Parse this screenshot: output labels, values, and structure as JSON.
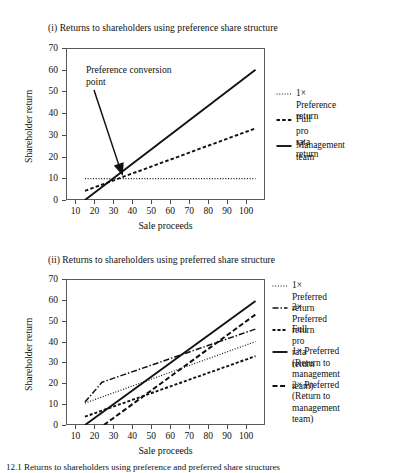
{
  "figure": {
    "caption": "12.1   Returns to shareholders using preference and preferred share structures"
  },
  "panels": [
    {
      "id": "panel-1",
      "title": "(i) Returns to shareholders using preference share structure",
      "xlabel": "Sale proceeds",
      "ylabel": "Shareholder return",
      "annotation": "Preference conversion\npoint",
      "legend": [
        {
          "label": "1× Preference return",
          "style": "dotted"
        },
        {
          "label": "Full pro rata return",
          "style": "dashed"
        },
        {
          "label": "Management team",
          "style": "solid"
        }
      ]
    },
    {
      "id": "panel-2",
      "title": "(ii) Returns to shareholders using preferred share structure",
      "xlabel": "Sale proceeds",
      "ylabel": "Shareholder return",
      "legend": [
        {
          "label": "1× Preferred return",
          "style": "dotted"
        },
        {
          "label": "2× Preferred return",
          "style": "dashdot"
        },
        {
          "label": "Full pro rata return",
          "style": "dashed-short"
        },
        {
          "label": "1× Preferred (Return to\nmanagement team)",
          "style": "solid"
        },
        {
          "label": "2× Preferred (Return to\nmanagement team)",
          "style": "dashed-long"
        }
      ]
    }
  ],
  "chart_data": [
    {
      "type": "line",
      "title": "(i) Returns to shareholders using preference share structure",
      "xlabel": "Sale proceeds",
      "ylabel": "Shareholder return",
      "xlim": [
        5,
        110
      ],
      "ylim": [
        0,
        70
      ],
      "xticks": [
        10,
        20,
        30,
        40,
        50,
        60,
        70,
        80,
        90,
        100
      ],
      "yticks": [
        0,
        10,
        20,
        30,
        40,
        50,
        60,
        70
      ],
      "grid": false,
      "legend_position": "right",
      "annotations": [
        {
          "text": "Preference conversion point",
          "points_to_x": 35,
          "points_to_y": 11
        }
      ],
      "series": [
        {
          "name": "1× Preference return",
          "style": "dotted",
          "x": [
            15,
            25,
            105
          ],
          "y": [
            9.8,
            9.8,
            9.8
          ]
        },
        {
          "name": "Full pro rata return",
          "style": "dashed",
          "x": [
            15,
            105
          ],
          "y": [
            4.2,
            33.0
          ]
        },
        {
          "name": "Management team",
          "style": "solid",
          "x": [
            15,
            105
          ],
          "y": [
            0.0,
            60.0
          ]
        }
      ]
    },
    {
      "type": "line",
      "title": "(ii) Returns to shareholders using preferred share structure",
      "xlabel": "Sale proceeds",
      "ylabel": "Shareholder return",
      "xlim": [
        5,
        110
      ],
      "ylim": [
        0,
        70
      ],
      "xticks": [
        10,
        20,
        30,
        40,
        50,
        60,
        70,
        80,
        90,
        100
      ],
      "yticks": [
        0,
        10,
        20,
        30,
        40,
        50,
        60,
        70
      ],
      "grid": false,
      "legend_position": "right",
      "series": [
        {
          "name": "1× Preferred return",
          "style": "dotted",
          "x": [
            15,
            105
          ],
          "y": [
            10.5,
            40.0
          ]
        },
        {
          "name": "2× Preferred return",
          "style": "dashdot",
          "x": [
            15,
            24,
            105
          ],
          "y": [
            11.0,
            20.5,
            46.0
          ]
        },
        {
          "name": "Full pro rata return",
          "style": "dashed-short",
          "x": [
            15,
            105
          ],
          "y": [
            4.0,
            33.0
          ]
        },
        {
          "name": "1× Preferred (Return to management team)",
          "style": "solid",
          "x": [
            15,
            105
          ],
          "y": [
            0.0,
            59.5
          ]
        },
        {
          "name": "2× Preferred (Return to management team)",
          "style": "dashed-long",
          "x": [
            25,
            105
          ],
          "y": [
            0.0,
            53.0
          ]
        }
      ]
    }
  ]
}
